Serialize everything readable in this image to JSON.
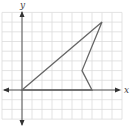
{
  "diagram": {
    "type": "coordinate-plane",
    "axes": {
      "x_label": "x",
      "y_label": "y",
      "origin_px": [
        22,
        90
      ],
      "unit_px": [
        10,
        9.7
      ],
      "grid_x_range": [
        -2,
        10
      ],
      "grid_y_range": [
        -3,
        8
      ]
    },
    "polygon": {
      "vertices": [
        [
          0,
          0
        ],
        [
          8,
          7
        ],
        [
          6,
          2
        ],
        [
          7,
          0
        ]
      ],
      "stroke": "#666666"
    },
    "colors": {
      "grid": "#dcdcdc",
      "axis": "#555555",
      "background": "#ffffff"
    }
  }
}
